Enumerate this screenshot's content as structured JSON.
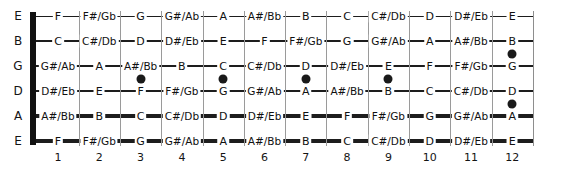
{
  "diagram": {
    "type": "guitar-fretboard",
    "colors": {
      "note_text": "#101010",
      "string": "#1d1d1d",
      "fret_line": "#9a9a9a",
      "nut": "#111111",
      "inlay": "#1a1a1a",
      "background": "#ffffff"
    },
    "open_strings": [
      "E",
      "B",
      "G",
      "D",
      "A",
      "E"
    ],
    "fret_numbers": [
      "1",
      "2",
      "3",
      "4",
      "5",
      "6",
      "7",
      "8",
      "9",
      "10",
      "11",
      "12"
    ],
    "string_rows": [
      {
        "open": "E",
        "thickness": 1,
        "notes": [
          "F",
          "F#/Gb",
          "G",
          "G#/Ab",
          "A",
          "A#/Bb",
          "B",
          "C",
          "C#/Db",
          "D",
          "D#/Eb",
          "E"
        ]
      },
      {
        "open": "B",
        "thickness": 1,
        "notes": [
          "C",
          "C#/Db",
          "D",
          "D#/Eb",
          "E",
          "F",
          "F#/Gb",
          "G",
          "G#/Ab",
          "A",
          "A#/Bb",
          "B"
        ]
      },
      {
        "open": "G",
        "thickness": 2,
        "notes": [
          "G#/Ab",
          "A",
          "A#/Bb",
          "B",
          "C",
          "C#/Db",
          "D",
          "D#/Eb",
          "E",
          "F",
          "F#/Gb",
          "G"
        ]
      },
      {
        "open": "D",
        "thickness": 2,
        "notes": [
          "D#/Eb",
          "E",
          "F",
          "F#/Gb",
          "G",
          "G#/Ab",
          "A",
          "A#/Bb",
          "B",
          "C",
          "C#/Db",
          "D"
        ]
      },
      {
        "open": "A",
        "thickness": 3,
        "notes": [
          "A#/Bb",
          "B",
          "C",
          "C#/Db",
          "D",
          "D#/Eb",
          "E",
          "F",
          "F#/Gb",
          "G",
          "G#/Ab",
          "A"
        ]
      },
      {
        "open": "E",
        "thickness": 4,
        "notes": [
          "F",
          "F#/Gb",
          "G",
          "G#/Ab",
          "A",
          "A#/Bb",
          "B",
          "C",
          "C#/Db",
          "D",
          "D#/Eb",
          "E"
        ]
      }
    ],
    "inlays": [
      {
        "fret": 3,
        "between_strings": "G-D"
      },
      {
        "fret": 5,
        "between_strings": "G-D"
      },
      {
        "fret": 7,
        "between_strings": "G-D"
      },
      {
        "fret": 9,
        "between_strings": "G-D"
      },
      {
        "fret": 12,
        "between_strings": "B-G"
      },
      {
        "fret": 12,
        "between_strings": "D-A"
      }
    ]
  }
}
